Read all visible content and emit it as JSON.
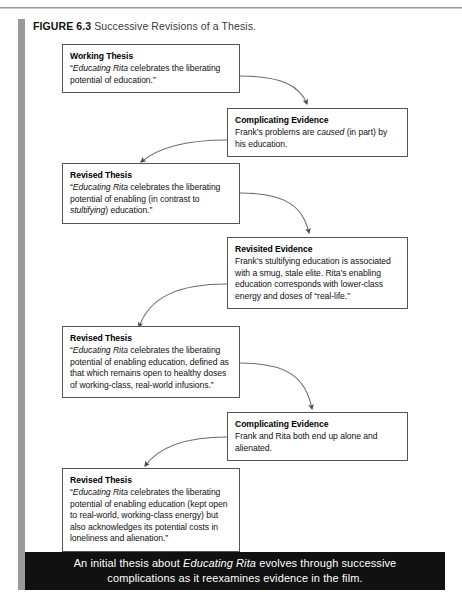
{
  "figure": {
    "number_label": "FIGURE 6.3",
    "title": "Successive Revisions of a Thesis."
  },
  "colors": {
    "rule_gray": "#9a9a9a",
    "box_border": "#555555",
    "caption_background": "#111111",
    "caption_text": "#ffffff",
    "page_background": "#ffffff"
  },
  "nodes": [
    {
      "id": "working-thesis",
      "title": "Working Thesis",
      "body_html": "“<i>Educating Rita</i> celebrates the liberating potential of education.”",
      "body_text": "“Educating Rita celebrates the liberating potential of education.”"
    },
    {
      "id": "complicating-evidence-1",
      "title": "Complicating Evidence",
      "body_html": "Frank’s problems are <i>caused</i> (in part) by his education.",
      "body_text": "Frank’s problems are caused (in part) by his education."
    },
    {
      "id": "revised-thesis-1",
      "title": "Revised Thesis",
      "body_html": "“<i>Educating Rita</i> celebrates the liberating potential of enabling (in contrast to <i>stultifying</i>) education.”",
      "body_text": "“Educating Rita celebrates the liberating potential of enabling (in contrast to stultifying) education.”"
    },
    {
      "id": "revisited-evidence",
      "title": "Revisited Evidence",
      "body_html": "Frank’s stultifying education is associated with a smug, stale elite. Rita’s enabling education corresponds with lower-class energy and doses of “real-life.”",
      "body_text": "Frank’s stultifying education is associated with a smug, stale elite. Rita’s enabling education corresponds with lower-class energy and doses of “real-life.”"
    },
    {
      "id": "revised-thesis-2",
      "title": "Revised Thesis",
      "body_html": "“<i>Educating Rita</i> celebrates the liberating potential of enabling education, defined as that which remains open to healthy doses of working-class, real-world infusions.”",
      "body_text": "“Educating Rita celebrates the liberating potential of enabling education, defined as that which remains open to healthy doses of working-class, real-world infusions.”"
    },
    {
      "id": "complicating-evidence-2",
      "title": "Complicating Evidence",
      "body_html": "Frank and Rita both end up alone and alienated.",
      "body_text": "Frank and Rita both end up alone and alienated."
    },
    {
      "id": "revised-thesis-3",
      "title": "Revised Thesis",
      "body_html": "“<i>Educating Rita</i> celebrates the liberating potential of enabling education (kept open to real-world, working-class energy) but also acknowledges its potential costs in loneliness and alienation.”",
      "body_text": "“Educating Rita celebrates the liberating potential of enabling education (kept open to real-world, working-class energy) but also acknowledges its potential costs in loneliness and alienation.”"
    }
  ],
  "caption": {
    "html": "An initial thesis about <i>Educating Rita</i> evolves through successive complications as it reexamines evidence in the film.",
    "text": "An initial thesis about Educating Rita evolves through successive complications as it reexamines evidence in the film."
  }
}
